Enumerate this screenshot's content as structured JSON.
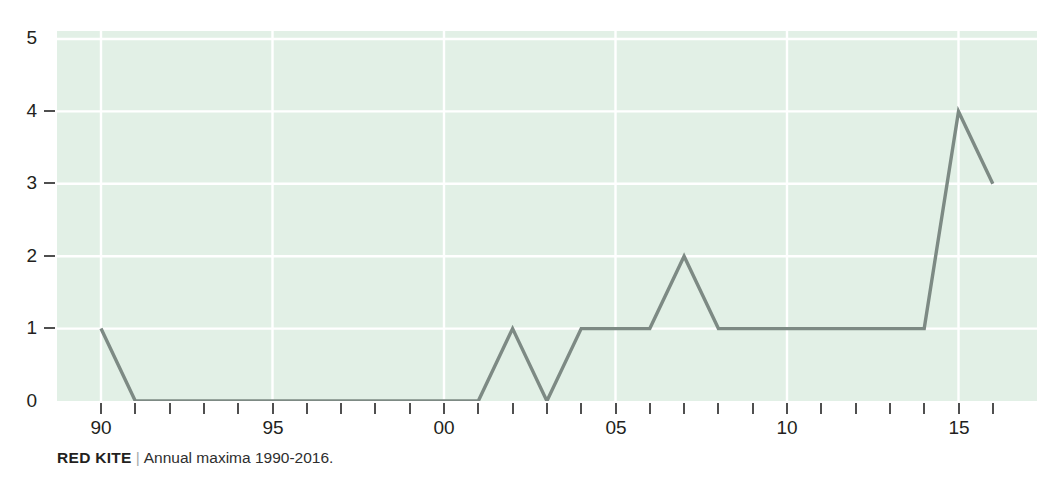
{
  "header": {
    "clipped_text": ""
  },
  "caption": {
    "species": "RED KITE",
    "separator": "|",
    "description": "Annual maxima 1990-2016."
  },
  "axes": {
    "y_ticks": [
      "0",
      "1",
      "2",
      "3",
      "4",
      "5"
    ],
    "x_labels": [
      "90",
      "95",
      "00",
      "05",
      "10",
      "15"
    ]
  },
  "colors": {
    "plot_background": "#e2f0e6",
    "gridline": "#ffffff",
    "line": "#7d8a84",
    "text": "#231f20",
    "tick": "#4f4f4f"
  },
  "chart_data": {
    "type": "line",
    "title": "RED KITE",
    "subtitle": "Annual maxima 1990-2016.",
    "xlabel": "",
    "ylabel": "",
    "x": [
      1990,
      1991,
      1992,
      1993,
      1994,
      1995,
      1996,
      1997,
      1998,
      1999,
      2000,
      2001,
      2002,
      2003,
      2004,
      2005,
      2006,
      2007,
      2008,
      2009,
      2010,
      2011,
      2012,
      2013,
      2014,
      2015,
      2016
    ],
    "x_tick_labels": [
      "90",
      "95",
      "00",
      "05",
      "10",
      "15"
    ],
    "x_tick_values": [
      1990,
      1995,
      2000,
      2005,
      2010,
      2015
    ],
    "values": [
      1,
      0,
      0,
      0,
      0,
      0,
      0,
      0,
      0,
      0,
      0,
      0,
      1,
      0,
      1,
      1,
      1,
      2,
      1,
      1,
      1,
      1,
      1,
      1,
      1,
      4,
      3
    ],
    "series": [
      {
        "name": "Annual maxima",
        "values": [
          1,
          0,
          0,
          0,
          0,
          0,
          0,
          0,
          0,
          0,
          0,
          0,
          1,
          0,
          1,
          1,
          1,
          2,
          1,
          1,
          1,
          1,
          1,
          1,
          1,
          4,
          3
        ]
      }
    ],
    "ylim": [
      0,
      5
    ],
    "xlim": [
      1989.2,
      1017.0
    ],
    "y_ticks": [
      0,
      1,
      2,
      3,
      4,
      5
    ],
    "grid": true,
    "grid_axis": "both",
    "legend": false,
    "legend_position": "none"
  }
}
